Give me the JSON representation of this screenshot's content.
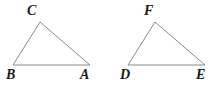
{
  "figure": {
    "background_color": "#ffffff",
    "line_color": "#8a8a8a",
    "label_color": "#1a1a1a",
    "width": 220,
    "height": 88,
    "shapes": [
      {
        "name": "triangle-abc",
        "label": "Triangle ABC",
        "vertices": [
          {
            "label": "C",
            "x": 40,
            "y": 22
          },
          {
            "label": "A",
            "x": 90,
            "y": 65
          },
          {
            "label": "B",
            "x": 13,
            "y": 65
          }
        ],
        "label_positions": [
          {
            "label": "C",
            "left": 27,
            "top": 4
          },
          {
            "label": "A",
            "left": 80,
            "top": 68
          },
          {
            "label": "B",
            "left": 6,
            "top": 68
          }
        ]
      },
      {
        "name": "triangle-def",
        "label": "Triangle DEF",
        "vertices": [
          {
            "label": "F",
            "x": 155,
            "y": 22
          },
          {
            "label": "E",
            "x": 205,
            "y": 65
          },
          {
            "label": "D",
            "x": 128,
            "y": 65
          }
        ],
        "label_positions": [
          {
            "label": "F",
            "left": 144,
            "top": 4
          },
          {
            "label": "E",
            "left": 196,
            "top": 68
          },
          {
            "label": "D",
            "left": 120,
            "top": 68
          }
        ]
      }
    ]
  }
}
